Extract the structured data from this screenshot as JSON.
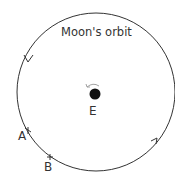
{
  "diagram": {
    "title": "Moon's orbit",
    "earth_label": "E",
    "points": [
      {
        "label": "A"
      },
      {
        "label": "B"
      }
    ],
    "colors": {
      "line": "#333333",
      "earth": "#111111",
      "rotation_arrow": "#999999"
    }
  }
}
